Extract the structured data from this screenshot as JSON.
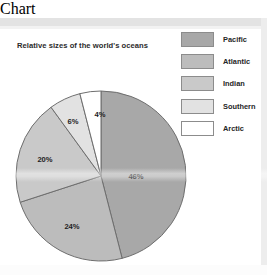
{
  "chart_data": {
    "type": "pie",
    "title": "Relative sizes of the world's oceans",
    "categories": [
      "Pacific",
      "Atlantic",
      "Indian",
      "Southern",
      "Arctic"
    ],
    "values": [
      46,
      24,
      20,
      6,
      4
    ],
    "value_labels": [
      "46%",
      "24%",
      "20%",
      "6%",
      "4%"
    ],
    "colors": [
      "#a8a8a8",
      "#bcbcbc",
      "#c9c9c9",
      "#e2e2e2",
      "#ffffff"
    ],
    "stroke": "#6e6e6e",
    "start_angle_deg": 0,
    "direction": "clockwise",
    "legend_position": "right",
    "grid": false,
    "xlabel": "",
    "ylabel": ""
  },
  "title": {
    "text": "Relative sizes of the world's oceans"
  },
  "legend": {
    "items": [
      {
        "label": "Pacific",
        "color": "#a8a8a8"
      },
      {
        "label": "Atlantic",
        "color": "#bcbcbc"
      },
      {
        "label": "Indian",
        "color": "#c9c9c9"
      },
      {
        "label": "Southern",
        "color": "#e2e2e2"
      },
      {
        "label": "Arctic",
        "color": "#ffffff"
      }
    ]
  },
  "pie": {
    "center_x": 101,
    "center_y": 158,
    "radius": 85,
    "labels": [
      {
        "text": "46%",
        "x": 136,
        "y": 158
      },
      {
        "text": "24%",
        "x": 72,
        "y": 208
      },
      {
        "text": "20%",
        "x": 45,
        "y": 141
      },
      {
        "text": "6%",
        "x": 73,
        "y": 103
      },
      {
        "text": "4%",
        "x": 100,
        "y": 96
      }
    ]
  }
}
